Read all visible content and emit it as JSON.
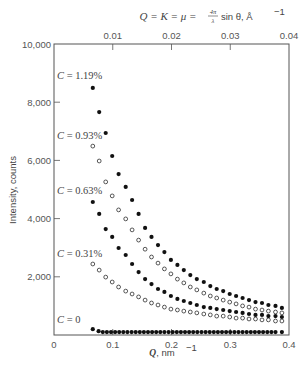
{
  "chart_data": {
    "type": "scatter",
    "title": "",
    "top_axis": {
      "label_parts": [
        "Q = K = μ = ",
        "4π",
        "λ",
        " sin θ, Å",
        "−1"
      ],
      "label_text": "Q = K = μ = (4π/λ) sin θ, Å^-1",
      "ticks": [
        0.01,
        0.02,
        0.03,
        0.04
      ],
      "tick_labels": [
        "0.01",
        "0.02",
        "0.03",
        "0.04"
      ],
      "range": [
        0,
        0.04
      ]
    },
    "xlabel": "Q, nm^-1",
    "xlabel_parts": [
      "Q",
      ", nm",
      "−1"
    ],
    "ylabel": "Intensity, counts",
    "xlim": [
      0,
      0.4
    ],
    "ylim": [
      0,
      10000
    ],
    "x_ticks": [
      0,
      0.1,
      0.2,
      0.3,
      0.4
    ],
    "x_tick_labels": [
      "0",
      "0.1",
      "0.2",
      "0.3",
      "0.4"
    ],
    "y_ticks": [
      2000,
      4000,
      6000,
      8000,
      10000
    ],
    "y_tick_labels": [
      "2,000",
      "4,000",
      "6,000",
      "8,000",
      "10,000"
    ],
    "grid": false,
    "legend": "inline labels at left inside plot",
    "series": [
      {
        "name": "C = 1.19%",
        "marker": "filled",
        "label_y": 8900,
        "x": [
          0.066,
          0.077,
          0.088,
          0.099,
          0.11,
          0.122,
          0.133,
          0.144,
          0.155,
          0.166,
          0.177,
          0.188,
          0.199,
          0.21,
          0.221,
          0.232,
          0.243,
          0.255,
          0.266,
          0.277,
          0.288,
          0.299,
          0.31,
          0.321,
          0.332,
          0.343,
          0.354,
          0.365,
          0.377,
          0.388
        ],
        "values": [
          8490,
          7660,
          6940,
          6150,
          5530,
          5090,
          4640,
          4160,
          3680,
          3370,
          3090,
          2850,
          2580,
          2410,
          2230,
          2060,
          1920,
          1820,
          1680,
          1580,
          1510,
          1410,
          1340,
          1270,
          1200,
          1130,
          1100,
          1030,
          1000,
          930
        ]
      },
      {
        "name": "C = 0.93%",
        "marker": "open",
        "label_y": 6850,
        "x": [
          0.066,
          0.077,
          0.088,
          0.099,
          0.11,
          0.122,
          0.133,
          0.144,
          0.155,
          0.166,
          0.177,
          0.188,
          0.199,
          0.21,
          0.221,
          0.232,
          0.243,
          0.255,
          0.266,
          0.277,
          0.288,
          0.299,
          0.31,
          0.321,
          0.332,
          0.343,
          0.354,
          0.365,
          0.377,
          0.388
        ],
        "values": [
          6490,
          5980,
          5260,
          4780,
          4300,
          3990,
          3610,
          3260,
          2950,
          2680,
          2470,
          2270,
          2100,
          1920,
          1790,
          1650,
          1550,
          1440,
          1340,
          1270,
          1200,
          1130,
          1070,
          1000,
          960,
          890,
          860,
          820,
          790,
          760
        ]
      },
      {
        "name": "C = 0.63%",
        "marker": "filled",
        "label_y": 4950,
        "x": [
          0.066,
          0.077,
          0.088,
          0.099,
          0.11,
          0.122,
          0.133,
          0.144,
          0.155,
          0.166,
          0.177,
          0.188,
          0.199,
          0.21,
          0.221,
          0.232,
          0.243,
          0.255,
          0.266,
          0.277,
          0.288,
          0.299,
          0.31,
          0.321,
          0.332,
          0.343,
          0.354,
          0.365,
          0.377,
          0.388
        ],
        "values": [
          4570,
          4160,
          3640,
          3370,
          2990,
          2750,
          2440,
          2160,
          1920,
          1750,
          1580,
          1480,
          1340,
          1240,
          1170,
          1100,
          1030,
          960,
          930,
          890,
          860,
          820,
          790,
          760,
          720,
          690,
          690,
          650,
          650,
          620
        ]
      },
      {
        "name": "C = 0.31%",
        "marker": "open",
        "label_y": 2800,
        "x": [
          0.066,
          0.077,
          0.088,
          0.099,
          0.11,
          0.122,
          0.133,
          0.144,
          0.155,
          0.166,
          0.177,
          0.188,
          0.199,
          0.21,
          0.221,
          0.232,
          0.243,
          0.255,
          0.266,
          0.277,
          0.288,
          0.299,
          0.31,
          0.321,
          0.332,
          0.343,
          0.354,
          0.365,
          0.377,
          0.388
        ],
        "values": [
          2440,
          2230,
          1990,
          1820,
          1650,
          1510,
          1410,
          1310,
          1200,
          1100,
          1030,
          960,
          890,
          860,
          820,
          790,
          760,
          720,
          690,
          650,
          650,
          620,
          580,
          580,
          550,
          550,
          520,
          520,
          480,
          480
        ]
      },
      {
        "name": "C = 0",
        "marker": "filled",
        "label_y": 500,
        "x": [
          0.066,
          0.076,
          0.083,
          0.09,
          0.097,
          0.104,
          0.111,
          0.118,
          0.125,
          0.132,
          0.139,
          0.146,
          0.153,
          0.16,
          0.167,
          0.174,
          0.181,
          0.188,
          0.195,
          0.202,
          0.209,
          0.216,
          0.223,
          0.23,
          0.237,
          0.244,
          0.251,
          0.258,
          0.265,
          0.272,
          0.279,
          0.286,
          0.293,
          0.3,
          0.307,
          0.314,
          0.321,
          0.328,
          0.335,
          0.342,
          0.349,
          0.356,
          0.363,
          0.37,
          0.377,
          0.388
        ],
        "values": [
          200,
          130,
          100,
          100,
          100,
          100,
          100,
          100,
          100,
          100,
          100,
          100,
          100,
          100,
          100,
          100,
          100,
          100,
          100,
          100,
          100,
          100,
          100,
          100,
          100,
          100,
          100,
          100,
          100,
          100,
          100,
          100,
          100,
          100,
          100,
          100,
          100,
          100,
          100,
          100,
          100,
          100,
          100,
          100,
          100,
          100
        ]
      }
    ]
  },
  "colors": {
    "axis": "#555555",
    "marker": "#111111",
    "background": "#ffffff"
  }
}
